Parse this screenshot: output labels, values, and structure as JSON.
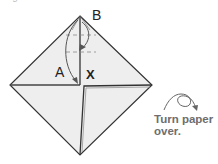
{
  "caption": {
    "top_text": "Begin with crease marks..."
  },
  "diagram": {
    "paper_fill": "#eeeeee",
    "line_color": "#333333",
    "fold_line_color": "#555555",
    "labels": {
      "b": "B",
      "a": "A",
      "x": "X"
    },
    "points": {
      "top": [
        80,
        16
      ],
      "left": [
        10,
        85
      ],
      "right": [
        152,
        85
      ],
      "bottom": [
        80,
        155
      ],
      "center": [
        80,
        85
      ]
    }
  },
  "instruction": {
    "line1": "Turn paper",
    "line2": "over.",
    "icon": "turn-over-icon"
  }
}
